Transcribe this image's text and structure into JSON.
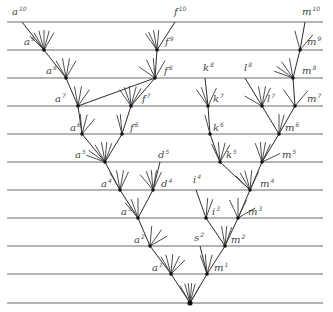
{
  "diagram": {
    "title": "",
    "colors": {
      "background": "#ffffff",
      "line": "#6a6a6a",
      "edge": "#2b2b2b",
      "label": "#444444"
    },
    "levels": [
      {
        "index": 10,
        "y": 22
      },
      {
        "index": 9,
        "y": 50
      },
      {
        "index": 8,
        "y": 78
      },
      {
        "index": 7,
        "y": 106
      },
      {
        "index": 6,
        "y": 134
      },
      {
        "index": 5,
        "y": 162
      },
      {
        "index": 4,
        "y": 190
      },
      {
        "index": 3,
        "y": 218
      },
      {
        "index": 2,
        "y": 246
      },
      {
        "index": 1,
        "y": 274
      },
      {
        "index": 0,
        "y": 303
      }
    ],
    "line_x": [
      7,
      323
    ],
    "nodes": [
      {
        "id": "a10",
        "letter": "a",
        "sup": "10",
        "x": 22,
        "y": 22,
        "lx": 12,
        "ly": 15
      },
      {
        "id": "a9",
        "letter": "a",
        "sup": "9",
        "x": 44,
        "y": 50,
        "lx": 24,
        "ly": 45
      },
      {
        "id": "a8",
        "letter": "a",
        "sup": "8",
        "x": 66,
        "y": 78,
        "lx": 46,
        "ly": 74
      },
      {
        "id": "a7",
        "letter": "a",
        "sup": "7",
        "x": 78,
        "y": 106,
        "lx": 55,
        "ly": 102
      },
      {
        "id": "a6",
        "letter": "a",
        "sup": "6",
        "x": 82,
        "y": 134,
        "lx": 70,
        "ly": 131
      },
      {
        "id": "a5",
        "letter": "a",
        "sup": "5",
        "x": 105,
        "y": 162,
        "lx": 75,
        "ly": 158
      },
      {
        "id": "a4",
        "letter": "a",
        "sup": "4",
        "x": 120,
        "y": 190,
        "lx": 101,
        "ly": 187
      },
      {
        "id": "a3",
        "letter": "a",
        "sup": "3",
        "x": 138,
        "y": 218,
        "lx": 121,
        "ly": 215
      },
      {
        "id": "a2",
        "letter": "a",
        "sup": "2",
        "x": 150,
        "y": 246,
        "lx": 134,
        "ly": 243
      },
      {
        "id": "a1",
        "letter": "a",
        "sup": "1",
        "x": 171,
        "y": 274,
        "lx": 152,
        "ly": 271
      },
      {
        "id": "f10",
        "letter": "f",
        "sup": "10",
        "x": 175,
        "y": 22,
        "lx": 174,
        "ly": 15
      },
      {
        "id": "f9",
        "letter": "f",
        "sup": "9",
        "x": 157,
        "y": 50,
        "lx": 165,
        "ly": 45
      },
      {
        "id": "f8",
        "letter": "f",
        "sup": "8",
        "x": 155,
        "y": 78,
        "lx": 164,
        "ly": 74
      },
      {
        "id": "f7",
        "letter": "f",
        "sup": "7",
        "x": 131,
        "y": 106,
        "lx": 142,
        "ly": 102
      },
      {
        "id": "f6",
        "letter": "f",
        "sup": "6",
        "x": 122,
        "y": 134,
        "lx": 130,
        "ly": 131
      },
      {
        "id": "d5",
        "letter": "d",
        "sup": "5",
        "x": 160,
        "y": 162,
        "lx": 158,
        "ly": 158
      },
      {
        "id": "d4",
        "letter": "d",
        "sup": "4",
        "x": 153,
        "y": 190,
        "lx": 161,
        "ly": 187
      },
      {
        "id": "k8",
        "letter": "k",
        "sup": "8",
        "x": 205,
        "y": 78,
        "lx": 203,
        "ly": 71
      },
      {
        "id": "k7",
        "letter": "k",
        "sup": "7",
        "x": 208,
        "y": 106,
        "lx": 213,
        "ly": 102
      },
      {
        "id": "k6",
        "letter": "k",
        "sup": "6",
        "x": 210,
        "y": 134,
        "lx": 213,
        "ly": 131
      },
      {
        "id": "k5",
        "letter": "k",
        "sup": "5",
        "x": 220,
        "y": 162,
        "lx": 226,
        "ly": 158
      },
      {
        "id": "l8",
        "letter": "l",
        "sup": "8",
        "x": 245,
        "y": 78,
        "lx": 244,
        "ly": 71
      },
      {
        "id": "l7",
        "letter": "l",
        "sup": "7",
        "x": 262,
        "y": 106,
        "lx": 267,
        "ly": 102
      },
      {
        "id": "m10",
        "letter": "m",
        "sup": "10",
        "x": 305,
        "y": 22,
        "lx": 302,
        "ly": 15
      },
      {
        "id": "m9",
        "letter": "m",
        "sup": "9",
        "x": 300,
        "y": 50,
        "lx": 307,
        "ly": 45
      },
      {
        "id": "m8",
        "letter": "m",
        "sup": "8",
        "x": 293,
        "y": 78,
        "lx": 302,
        "ly": 74
      },
      {
        "id": "m7",
        "letter": "m",
        "sup": "7",
        "x": 295,
        "y": 106,
        "lx": 307,
        "ly": 102
      },
      {
        "id": "m6",
        "letter": "m",
        "sup": "6",
        "x": 279,
        "y": 134,
        "lx": 285,
        "ly": 131
      },
      {
        "id": "m5",
        "letter": "m",
        "sup": "5",
        "x": 262,
        "y": 162,
        "lx": 282,
        "ly": 158
      },
      {
        "id": "m4",
        "letter": "m",
        "sup": "4",
        "x": 250,
        "y": 190,
        "lx": 260,
        "ly": 187
      },
      {
        "id": "i4",
        "letter": "i",
        "sup": "4",
        "x": 196,
        "y": 190,
        "lx": 193,
        "ly": 183
      },
      {
        "id": "i3",
        "letter": "i",
        "sup": "3",
        "x": 206,
        "y": 218,
        "lx": 212,
        "ly": 215
      },
      {
        "id": "m3",
        "letter": "m",
        "sup": "3",
        "x": 238,
        "y": 218,
        "lx": 248,
        "ly": 215
      },
      {
        "id": "m2",
        "letter": "m",
        "sup": "2",
        "x": 225,
        "y": 246,
        "lx": 231,
        "ly": 243
      },
      {
        "id": "s2",
        "letter": "s",
        "sup": "2",
        "x": 200,
        "y": 246,
        "lx": 194,
        "ly": 241
      },
      {
        "id": "m1",
        "letter": "m",
        "sup": "1",
        "x": 207,
        "y": 274,
        "lx": 214,
        "ly": 271
      },
      {
        "id": "root",
        "letter": "",
        "sup": "",
        "x": 190,
        "y": 303,
        "lx": 0,
        "ly": 0
      }
    ],
    "edges": [
      [
        "a10",
        "a9"
      ],
      [
        "a9",
        "a8"
      ],
      [
        "a8",
        "a7"
      ],
      [
        "a7",
        "a6"
      ],
      [
        "a6",
        "a5"
      ],
      [
        "a5",
        "a4"
      ],
      [
        "a4",
        "a3"
      ],
      [
        "a3",
        "a2"
      ],
      [
        "a2",
        "a1"
      ],
      [
        "a1",
        "root"
      ],
      [
        "f10",
        "f9"
      ],
      [
        "f9",
        "f8"
      ],
      [
        "f8",
        "f7"
      ],
      [
        "f7",
        "f6"
      ],
      [
        "f6",
        "a5"
      ],
      [
        "f8",
        "a7"
      ],
      [
        "d5",
        "d4"
      ],
      [
        "d4",
        "a3"
      ],
      [
        "k8",
        "k7"
      ],
      [
        "k7",
        "k6"
      ],
      [
        "k6",
        "k5"
      ],
      [
        "k5",
        "m4"
      ],
      [
        "l8",
        "l7"
      ],
      [
        "l7",
        "m6"
      ],
      [
        "m10",
        "m9"
      ],
      [
        "m9",
        "m8"
      ],
      [
        "m8",
        "m7"
      ],
      [
        "m7",
        "m6"
      ],
      [
        "m6",
        "m5"
      ],
      [
        "m5",
        "m4"
      ],
      [
        "m4",
        "m3"
      ],
      [
        "m3",
        "m2"
      ],
      [
        "m2",
        "m1"
      ],
      [
        "m1",
        "root"
      ],
      [
        "i4",
        "i3"
      ],
      [
        "i3",
        "m2"
      ],
      [
        "s2",
        "m1"
      ]
    ],
    "fan_stubs": [
      {
        "at": "a9",
        "angles": [
          -60,
          -75,
          -90,
          -105,
          -120,
          -135
        ]
      },
      {
        "at": "a8",
        "angles": [
          -60,
          -80,
          -100,
          -120
        ]
      },
      {
        "at": "a7",
        "angles": [
          -55,
          -80,
          -100
        ]
      },
      {
        "at": "a6",
        "angles": [
          -50,
          -75,
          -95
        ]
      },
      {
        "at": "a5",
        "angles": [
          -70,
          -85,
          -100,
          -120,
          -145,
          -160
        ]
      },
      {
        "at": "a4",
        "angles": [
          -65,
          -80,
          -100,
          -120
        ]
      },
      {
        "at": "a3",
        "angles": [
          -90,
          -110,
          -130
        ]
      },
      {
        "at": "a2",
        "angles": [
          -30,
          -55,
          -85
        ]
      },
      {
        "at": "a1",
        "angles": [
          -45,
          -65,
          -85,
          -105,
          -120
        ]
      },
      {
        "at": "f9",
        "angles": [
          -85,
          -100,
          -115,
          -125
        ]
      },
      {
        "at": "f8",
        "angles": [
          -60,
          -95,
          -115,
          -145
        ]
      },
      {
        "at": "f7",
        "angles": [
          -60,
          -75,
          -95,
          -110,
          -125
        ]
      },
      {
        "at": "f6",
        "angles": [
          -95,
          -105
        ]
      },
      {
        "at": "d4",
        "angles": [
          -65,
          -80,
          -95,
          -110,
          -130
        ]
      },
      {
        "at": "k7",
        "angles": [
          -65,
          -110,
          -125
        ]
      },
      {
        "at": "k6",
        "angles": [
          -105
        ]
      },
      {
        "at": "k5",
        "angles": [
          -60,
          -75,
          -95,
          -115
        ]
      },
      {
        "at": "l7",
        "angles": [
          -65,
          -80,
          -100,
          -150
        ]
      },
      {
        "at": "m9",
        "angles": [
          -50,
          -105
        ]
      },
      {
        "at": "m8",
        "angles": [
          -100,
          -125,
          -145,
          -160
        ]
      },
      {
        "at": "m7",
        "angles": [
          -50,
          -125
        ]
      },
      {
        "at": "m6",
        "angles": [
          -75,
          -90
        ]
      },
      {
        "at": "m5",
        "angles": [
          -25,
          -65,
          -80,
          -95,
          -110
        ]
      },
      {
        "at": "m4",
        "angles": [
          -65,
          -85,
          -105,
          -120,
          -135
        ]
      },
      {
        "at": "i3",
        "angles": [
          -70,
          -85
        ]
      },
      {
        "at": "m3",
        "angles": [
          -30,
          -65,
          -90,
          -115
        ]
      },
      {
        "at": "m2",
        "angles": [
          -70,
          -85,
          -100
        ]
      },
      {
        "at": "m1",
        "angles": [
          -75,
          -95,
          -110
        ]
      },
      {
        "at": "root",
        "angles": [
          -60,
          -75,
          -85,
          -95,
          -105,
          -120
        ]
      }
    ]
  }
}
